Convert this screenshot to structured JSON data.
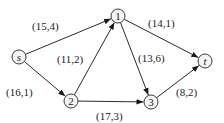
{
  "diagram": {
    "type": "flow-network",
    "nodes": [
      {
        "id": "s",
        "label": "s",
        "italic": true,
        "x": 19,
        "y": 57
      },
      {
        "id": "1",
        "label": "1",
        "italic": false,
        "x": 118,
        "y": 16
      },
      {
        "id": "t",
        "label": "t",
        "italic": true,
        "x": 205,
        "y": 61
      },
      {
        "id": "2",
        "label": "2",
        "italic": false,
        "x": 71,
        "y": 101
      },
      {
        "id": "3",
        "label": "3",
        "italic": false,
        "x": 151,
        "y": 102
      }
    ],
    "edges": [
      {
        "from": "s",
        "to": "1",
        "label": "(15,4)",
        "lx": 32,
        "ly": 30
      },
      {
        "from": "s",
        "to": "2",
        "label": "(16,1)",
        "lx": 6,
        "ly": 96
      },
      {
        "from": "2",
        "to": "1",
        "label": "(11,2)",
        "lx": 57,
        "ly": 63
      },
      {
        "from": "1",
        "to": "3",
        "label": "(13,6)",
        "lx": 138,
        "ly": 62
      },
      {
        "from": "1",
        "to": "t",
        "label": "(14,1)",
        "lx": 148,
        "ly": 27
      },
      {
        "from": "2",
        "to": "3",
        "label": "(17,3)",
        "lx": 96,
        "ly": 120
      },
      {
        "from": "3",
        "to": "t",
        "label": "(8,2)",
        "lx": 176,
        "ly": 96
      }
    ],
    "colors": {
      "line": "#2a2a2a",
      "node_fill": "#f4f4f4",
      "text": "#222222"
    }
  }
}
